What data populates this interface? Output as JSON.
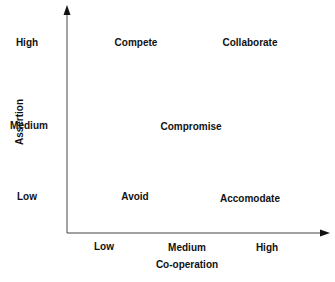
{
  "diagram": {
    "type": "conflict-handling-styles-matrix",
    "x_axis": {
      "title": "Co-operation",
      "ticks": [
        "Low",
        "Medium",
        "High"
      ]
    },
    "y_axis": {
      "title": "Assertion",
      "ticks": [
        "High",
        "Medium",
        "Low"
      ]
    },
    "styles": [
      {
        "label": "Compete",
        "cooperation": "Low",
        "assertion": "High"
      },
      {
        "label": "Collaborate",
        "cooperation": "High",
        "assertion": "High"
      },
      {
        "label": "Compromise",
        "cooperation": "Medium",
        "assertion": "Medium"
      },
      {
        "label": "Avoid",
        "cooperation": "Low",
        "assertion": "Low"
      },
      {
        "label": "Accomodate",
        "cooperation": "High",
        "assertion": "Low"
      }
    ],
    "colors": {
      "axis": "#333333",
      "text": "#111111",
      "background": "#ffffff"
    }
  }
}
